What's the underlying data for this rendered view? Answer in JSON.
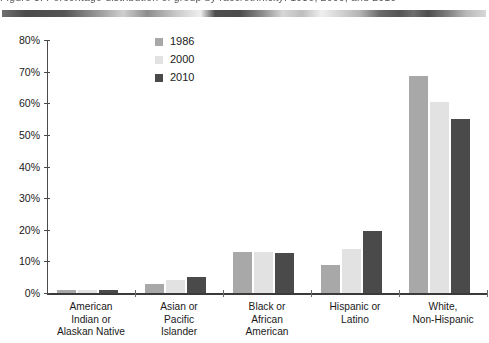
{
  "scan": {
    "ghost_caption": "Figure 3.  Percentage distribution of group by race/ethnicity:  1986, 2000, and 2010"
  },
  "chart_data": {
    "type": "bar",
    "title": "",
    "xlabel": "",
    "ylabel": "",
    "ylim": [
      0,
      80
    ],
    "grid": false,
    "legend_position": "inside-top-left",
    "value_suffix": "%",
    "yticks": [
      "0%",
      "10%",
      "20%",
      "30%",
      "40%",
      "50%",
      "60%",
      "70%",
      "80%"
    ],
    "ytick_values": [
      0,
      10,
      20,
      30,
      40,
      50,
      60,
      70,
      80
    ],
    "categories": [
      "American Indian or Alaskan Native",
      "Asian or Pacific Islander",
      "Black or African American",
      "Hispanic or Latino",
      "White, Non-Hispanic"
    ],
    "category_lines": [
      [
        "American",
        "Indian or",
        "Alaskan Native"
      ],
      [
        "Asian or",
        "Pacific",
        "Islander"
      ],
      [
        "Black or",
        "African",
        "American"
      ],
      [
        "Hispanic or",
        "Latino"
      ],
      [
        "White,",
        "Non-Hispanic"
      ]
    ],
    "series": [
      {
        "name": "1986",
        "color": "#a8a8a8",
        "values": [
          1.0,
          3.0,
          13.0,
          9.0,
          68.5
        ]
      },
      {
        "name": "2000",
        "color": "#e2e2e2",
        "values": [
          1.0,
          4.0,
          13.0,
          14.0,
          60.5
        ]
      },
      {
        "name": "2010",
        "color": "#4a4a4a",
        "values": [
          1.0,
          5.0,
          12.5,
          19.5,
          55.0
        ]
      }
    ]
  },
  "colors": {
    "axis": "#3a3a3a",
    "tick": "#4a4a4a",
    "text": "#1a1a1a",
    "background": "#ffffff"
  }
}
